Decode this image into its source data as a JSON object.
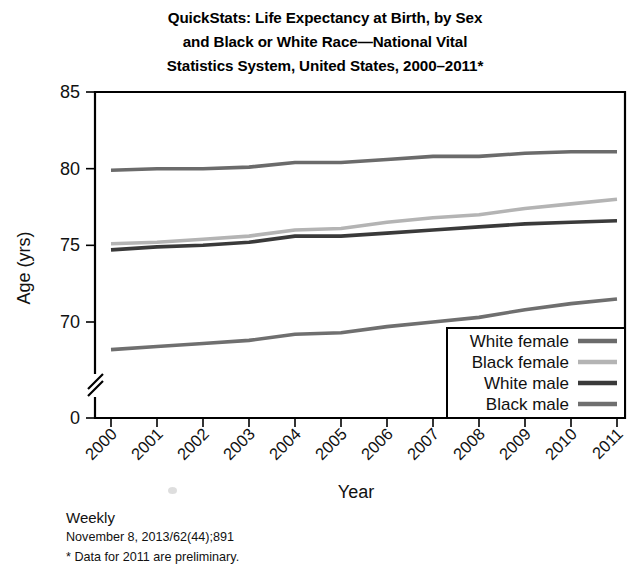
{
  "title": {
    "line1": "QuickStats: Life Expectancy at Birth, by Sex",
    "line2": "and Black or White Race—National Vital",
    "line3": "Statistics System, United States, 2000–2011*"
  },
  "footer": {
    "weekly": "Weekly",
    "citation": "November 8, 2013/62(44);891",
    "note": "* Data for 2011 are preliminary."
  },
  "axis": {
    "ylabel": "Age (yrs)",
    "xlabel": "Year",
    "yticks": [
      "0",
      "70",
      "75",
      "80",
      "85"
    ],
    "ybreak": true
  },
  "colors": {
    "white_female": "#6b6b6b",
    "black_female": "#b4b4b4",
    "white_male": "#3a3a3a",
    "black_male": "#6f6f6f",
    "axis": "#000000",
    "background": "#ffffff"
  },
  "chart_data": {
    "type": "line",
    "title": "QuickStats: Life Expectancy at Birth, by Sex and Black or White Race—National Vital Statistics System, United States, 2000–2011*",
    "xlabel": "Year",
    "ylabel": "Age (yrs)",
    "categories": [
      2000,
      2001,
      2002,
      2003,
      2004,
      2005,
      2006,
      2007,
      2008,
      2009,
      2010,
      2011
    ],
    "xticklabels": [
      "2000",
      "2001",
      "2002",
      "2003",
      "2004",
      "2005",
      "2006",
      "2007",
      "2008",
      "2009",
      "2010",
      "2011"
    ],
    "yticklabels": [
      "0",
      "70",
      "75",
      "80",
      "85"
    ],
    "ylim": [
      69,
      85
    ],
    "ybreak_between": [
      0,
      70
    ],
    "grid": false,
    "legend_position": "lower-right",
    "series": [
      {
        "name": "White female",
        "color": "#6b6b6b",
        "values": [
          79.9,
          80.0,
          80.0,
          80.1,
          80.4,
          80.4,
          80.6,
          80.8,
          80.8,
          81.0,
          81.1,
          81.1
        ]
      },
      {
        "name": "Black female",
        "color": "#b4b4b4",
        "values": [
          75.1,
          75.2,
          75.4,
          75.6,
          76.0,
          76.1,
          76.5,
          76.8,
          77.0,
          77.4,
          77.7,
          78.0
        ]
      },
      {
        "name": "White male",
        "color": "#3a3a3a",
        "values": [
          74.7,
          74.9,
          75.0,
          75.2,
          75.6,
          75.6,
          75.8,
          76.0,
          76.2,
          76.4,
          76.5,
          76.6
        ]
      },
      {
        "name": "Black male",
        "color": "#6f6f6f",
        "values": [
          68.2,
          68.4,
          68.6,
          68.8,
          69.2,
          69.3,
          69.7,
          70.0,
          70.3,
          70.8,
          71.2,
          71.5
        ]
      }
    ]
  },
  "legend": {
    "items": [
      {
        "label": "White female",
        "color": "#6b6b6b"
      },
      {
        "label": "Black female",
        "color": "#b4b4b4"
      },
      {
        "label": "White male",
        "color": "#3a3a3a"
      },
      {
        "label": "Black male",
        "color": "#6f6f6f"
      }
    ]
  }
}
